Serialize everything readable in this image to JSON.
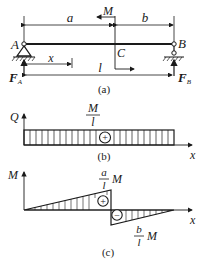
{
  "figure_a": {
    "caption": "(a)",
    "dim_a": "a",
    "dim_b": "b",
    "dim_x": "x",
    "dim_l": "l",
    "moment": "M",
    "point_A": "A",
    "point_B": "B",
    "point_C": "C",
    "force_A": "F",
    "force_A_sub": "A",
    "force_B": "F",
    "force_B_sub": "B"
  },
  "figure_b": {
    "caption": "(b)",
    "axis_y": "Q",
    "axis_x": "x",
    "value_num": "M",
    "value_den": "l",
    "sign": "+"
  },
  "figure_c": {
    "caption": "(c)",
    "axis_y": "M",
    "axis_x": "x",
    "pos_num": "a",
    "pos_den": "l",
    "pos_tail": "M",
    "neg_num": "b",
    "neg_den": "l",
    "neg_tail": "M",
    "pos_sign": "+",
    "neg_sign": "−"
  },
  "colors": {
    "ink": "#1a1a1a",
    "background": "#ffffff"
  }
}
